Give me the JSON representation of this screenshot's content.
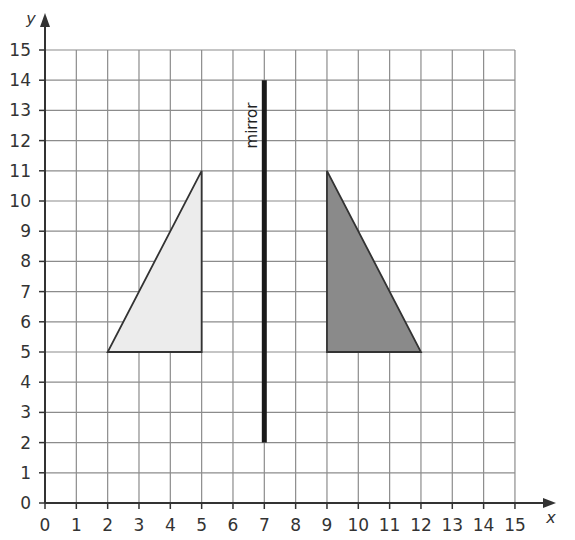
{
  "axes": {
    "x_label": "x",
    "y_label": "y",
    "x_range": [
      0,
      15
    ],
    "y_range": [
      0,
      15
    ],
    "x_ticks": [
      "0",
      "1",
      "2",
      "3",
      "4",
      "5",
      "6",
      "7",
      "8",
      "9",
      "10",
      "11",
      "12",
      "13",
      "14",
      "15"
    ],
    "y_ticks": [
      "0",
      "1",
      "2",
      "3",
      "4",
      "5",
      "6",
      "7",
      "8",
      "9",
      "10",
      "11",
      "12",
      "13",
      "14",
      "15"
    ]
  },
  "mirror": {
    "label": "mirror",
    "x": 7,
    "y_from": 2,
    "y_to": 14,
    "color": "#1a1a1a"
  },
  "shapes": [
    {
      "name": "original-triangle",
      "vertices": [
        [
          2,
          5
        ],
        [
          5,
          5
        ],
        [
          5,
          11
        ]
      ],
      "fill": "#ececec",
      "stroke": "#333333"
    },
    {
      "name": "reflected-triangle",
      "vertices": [
        [
          9,
          5
        ],
        [
          12,
          5
        ],
        [
          9,
          11
        ]
      ],
      "fill": "#8a8a8a",
      "stroke": "#333333"
    }
  ],
  "colors": {
    "grid": "#8c8c8c",
    "axis": "#333333"
  }
}
